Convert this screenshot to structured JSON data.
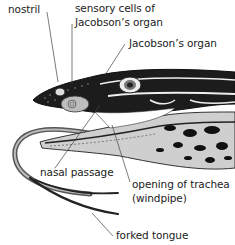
{
  "diagram": {
    "labels": {
      "nostril": "nostril",
      "sensory_line1": "sensory cells of",
      "sensory_line2": "Jacobson’s organ",
      "jacobsons_organ": "Jacobson’s organ",
      "nasal_passage": "nasal passage",
      "trachea_line1": "opening of trachea",
      "trachea_line2": "(windpipe)",
      "forked_tongue": "forked tongue"
    },
    "colors": {
      "text": "#222222",
      "leader": "#444444",
      "skin_dark": "#1a1a1a",
      "skin_light": "#e8e8e8",
      "mouth": "#c8c8c8",
      "tongue": "#9a9a9a"
    }
  }
}
